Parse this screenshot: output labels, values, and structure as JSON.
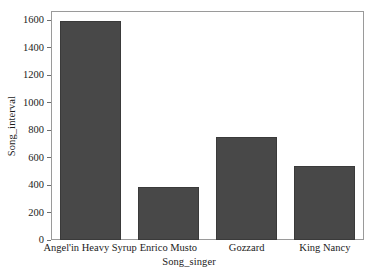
{
  "chart_data": {
    "type": "bar",
    "title": "",
    "subtitle": "",
    "xlabel": "Song_singer",
    "ylabel": "Song_interval",
    "categories": [
      "Angel'in Heavy Syrup",
      "Enrico Musto",
      "Gozzard",
      "King Nancy"
    ],
    "values": [
      1590,
      385,
      750,
      540
    ],
    "series": [
      {
        "name": "Song_interval",
        "values": [
          1590,
          385,
          750,
          540
        ]
      }
    ],
    "ylim": [
      0,
      1666
    ],
    "yticks": [
      0,
      200,
      400,
      600,
      800,
      1000,
      1200,
      1400,
      1600
    ],
    "ytick_labels": [
      "0",
      "200",
      "400",
      "600",
      "800",
      "1000",
      "1200",
      "1400",
      "1600"
    ],
    "grid": false,
    "legend": false,
    "legend_position": "none",
    "bar_color": "#484848",
    "bar_edge_color": "#3a3a3a",
    "frame_color": "#9a9a9a",
    "background_color": "#ffffff",
    "text_color": "#1b1b1b"
  },
  "axes": {
    "y_title": "Song_interval",
    "x_title": "Song_singer",
    "y_ticks": [
      {
        "label": "1600",
        "value": 1600
      },
      {
        "label": "1400",
        "value": 1400
      },
      {
        "label": "1200",
        "value": 1200
      },
      {
        "label": "1000",
        "value": 1000
      },
      {
        "label": "800",
        "value": 800
      },
      {
        "label": "600",
        "value": 600
      },
      {
        "label": "400",
        "value": 400
      },
      {
        "label": "200",
        "value": 200
      },
      {
        "label": "0",
        "value": 0
      }
    ],
    "x_ticks": [
      {
        "label": "Angel'in Heavy Syrup"
      },
      {
        "label": "Enrico Musto"
      },
      {
        "label": "Gozzard"
      },
      {
        "label": "King Nancy"
      }
    ]
  },
  "bars": [
    {
      "category": "Angel'in Heavy Syrup",
      "value": 1590
    },
    {
      "category": "Enrico Musto",
      "value": 385
    },
    {
      "category": "Gozzard",
      "value": 750
    },
    {
      "category": "King Nancy",
      "value": 540
    }
  ]
}
